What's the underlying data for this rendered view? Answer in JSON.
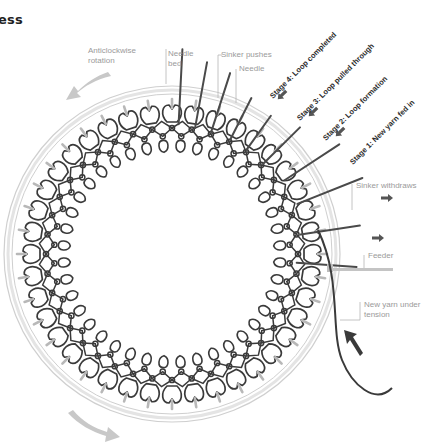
{
  "title": "ess",
  "labels": {
    "rotation": "Anticlockwise rotation",
    "rotation_line1": "Anticlockwise",
    "rotation_line2": "rotation",
    "needle_bed_line1": "Needle",
    "needle_bed_line2": "bed",
    "sinker_pushes": "Sinker pushes",
    "needle": "Needle",
    "sinker_withdraws": "Sinker withdraws",
    "feeder": "Feeder",
    "new_yarn_line1": "New yarn under",
    "new_yarn_line2": "tension"
  },
  "stages": [
    {
      "label": "Stage 4: Loop completed"
    },
    {
      "label": "Stage 3: Loop pulled through"
    },
    {
      "label": "Stage 2: Loop formation"
    },
    {
      "label": "Stage 1: New yarn fed in"
    }
  ],
  "colors": {
    "yarn": "#3a3a3a",
    "needle": "#b8b8b8",
    "ring": "#cfcfcf",
    "arrow_light": "#c8c8c8",
    "arrow_dark": "#555555",
    "label": "#9a9a9a"
  },
  "geometry": {
    "center": [
      172,
      254
    ],
    "ring_outer_r": 168,
    "ring_inner_r": 160,
    "loop_count": 40
  }
}
